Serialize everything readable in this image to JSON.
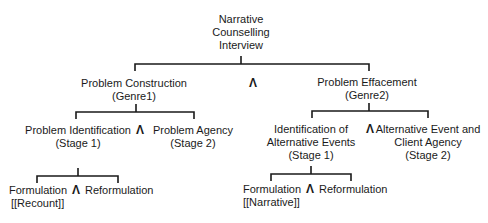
{
  "diagram": {
    "root": {
      "lines": [
        "Narrative",
        "Counselling",
        "Interview"
      ]
    },
    "and_symbol": "Λ",
    "genre1": {
      "title": "Problem Construction",
      "subtitle": "(Genre1)",
      "stage1": {
        "title": "Problem Identification",
        "subtitle": "(Stage 1)",
        "formulation": "Formulation",
        "formulation_type": "[[Recount]]",
        "reformulation": "Reformulation"
      },
      "stage2": {
        "title": "Problem Agency",
        "subtitle": "(Stage 2)"
      }
    },
    "genre2": {
      "title": "Problem Effacement",
      "subtitle": "(Genre2)",
      "stage1": {
        "line1": "Identification of",
        "line2": "Alternative Events",
        "subtitle": "(Stage 1)",
        "formulation": "Formulation",
        "formulation_type": "[[Narrative]]",
        "reformulation": "Reformulation"
      },
      "stage2": {
        "line1": "Alternative Event and",
        "line2": "Client Agency",
        "subtitle": "(Stage 2)"
      }
    },
    "stroke_color": "#1a1a1a"
  }
}
